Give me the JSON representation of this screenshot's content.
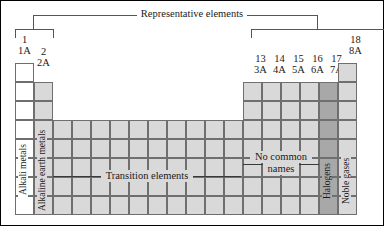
{
  "figure": {
    "background_color": "#ffffff",
    "border_color": "#000000"
  },
  "brackets": {
    "representative": {
      "label": "Representative elements",
      "line_color": "#555555"
    }
  },
  "groups": {
    "left": [
      {
        "number": "1",
        "letter": "1A"
      },
      {
        "number": "2",
        "letter": "2A"
      }
    ],
    "right": [
      {
        "number": "13",
        "letter": "3A"
      },
      {
        "number": "14",
        "letter": "4A"
      },
      {
        "number": "15",
        "letter": "5A"
      },
      {
        "number": "16",
        "letter": "6A"
      },
      {
        "number": "17",
        "letter": "7A"
      },
      {
        "number": "18",
        "letter": "8A"
      }
    ]
  },
  "column_captions": [
    {
      "text": "Alkali metals",
      "column": "1",
      "shading": "white"
    },
    {
      "text": "Alkaline earth metals",
      "column": "2",
      "shading": "gray"
    },
    {
      "text": "Halogens",
      "column": "17",
      "shading": "dark"
    },
    {
      "text": "Noble gases",
      "column": "18",
      "shading": "gray"
    }
  ],
  "region_labels": [
    {
      "text": "Transition elements",
      "shading": "gray"
    },
    {
      "text_line1": "No common",
      "text_line2": "names",
      "shading": "gray"
    }
  ],
  "colors": {
    "cell_white": "#ffffff",
    "cell_gray": "#d9d9d9",
    "cell_dark": "#a8a8a8",
    "grid_line": "#6f6f6f",
    "bracket_line": "#555555",
    "leader_line": "#3a3a3a",
    "text": "#1a1a1a"
  }
}
